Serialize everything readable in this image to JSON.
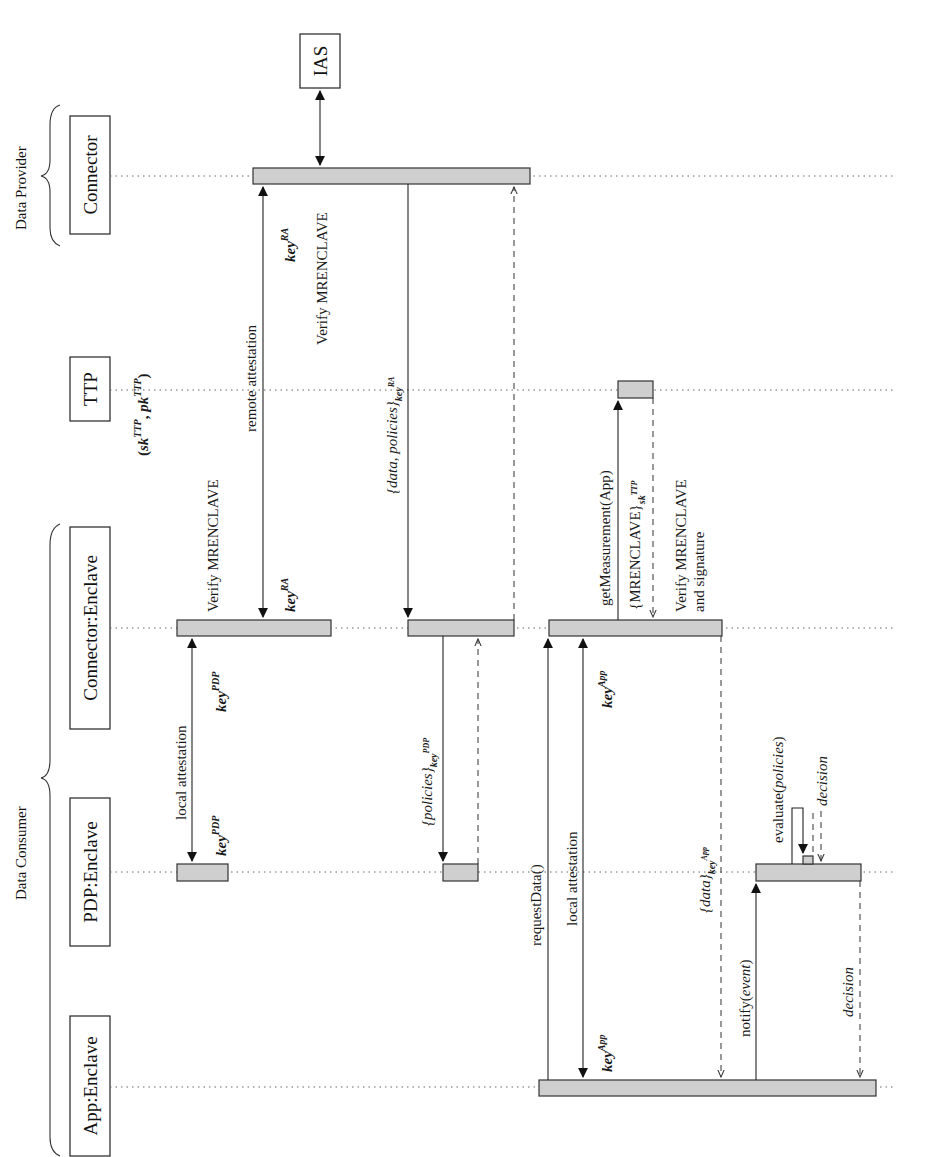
{
  "diagram": {
    "type": "sequence-diagram",
    "orientation": "rotated-90-ccw",
    "groups": [
      {
        "id": "provider",
        "label": "Data Provider"
      },
      {
        "id": "consumer",
        "label": "Data Consumer"
      }
    ],
    "participants": [
      {
        "id": "connector",
        "label": "Connector",
        "group": "provider"
      },
      {
        "id": "ias",
        "label": "IAS"
      },
      {
        "id": "ttp",
        "label": "TTP",
        "note": "(sk^TTP, pk^TTP)"
      },
      {
        "id": "conn_enclave",
        "label": "Connector:Enclave",
        "group": "consumer"
      },
      {
        "id": "pdp_enclave",
        "label": "PDP:Enclave",
        "group": "consumer"
      },
      {
        "id": "app_enclave",
        "label": "App:Enclave",
        "group": "consumer"
      }
    ],
    "ttp_keys": {
      "open": "(",
      "sk": "sk",
      "sk_sup": "TTP",
      "comma": ", ",
      "pk": "pk",
      "pk_sup": "TTP",
      "close": ")"
    },
    "messages": {
      "ias_link": "",
      "remote_attestation": "remote attestation",
      "verify_mrenclave_provider": "Verify MRENCLAVE",
      "verify_mrenclave_consumer": "Verify MRENCLAVE",
      "key_ra_provider": {
        "base": "key",
        "sup": "RA"
      },
      "key_ra_consumer": {
        "base": "key",
        "sup": "RA"
      },
      "data_policies": {
        "open": "{",
        "body": "data, policies",
        "close": "}",
        "sub": "key",
        "subsup": "RA"
      },
      "local_attestation_pdp": "local attestation",
      "key_pdp_conn": {
        "base": "key",
        "sup": "PDP"
      },
      "key_pdp_pdp": {
        "base": "key",
        "sup": "PDP"
      },
      "policies_pdp": {
        "open": "{",
        "body": "policies",
        "close": "}",
        "sub": "key",
        "subsup": "PDP"
      },
      "get_measurement": "getMeasurement(App)",
      "mrenclave_signed": {
        "open": "{",
        "body": "MRENCLAVE",
        "close": "}",
        "sub": "sk",
        "subsup": "TTP"
      },
      "verify_sig_line1": "Verify MRENCLAVE",
      "verify_sig_line2": "and signature",
      "request_data": "requestData()",
      "local_attestation_app": "local attestation",
      "key_app_conn": {
        "base": "key",
        "sup": "App"
      },
      "key_app_app": {
        "base": "key",
        "sup": "App"
      },
      "data_app": {
        "open": "{",
        "body": "data",
        "close": "}",
        "sub": "key",
        "subsup": "App"
      },
      "notify": {
        "fn": "notify(",
        "arg": "event",
        "close": ")"
      },
      "evaluate": {
        "fn": "evaluate(",
        "arg": "policies",
        "close": ")"
      },
      "decision_inner": "decision",
      "decision_return": "decision"
    }
  }
}
